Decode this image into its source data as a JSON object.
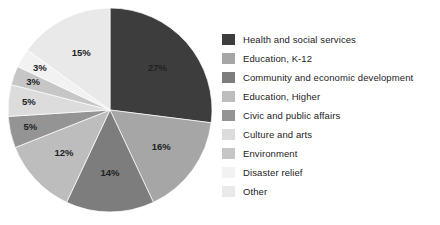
{
  "chart_data": {
    "type": "pie",
    "title": "",
    "subtitle": "",
    "xlabel": "",
    "ylabel": "",
    "legend_position": "right",
    "grid": false,
    "start_angle_deg": 0,
    "direction": "clockwise",
    "categories": [
      "Health and social services",
      "Education, K-12",
      "Community and economic development",
      "Education, Higher",
      "Civic and public affairs",
      "Culture and arts",
      "Environment",
      "Disaster relief",
      "Other"
    ],
    "values": [
      27,
      16,
      14,
      12,
      5,
      5,
      3,
      3,
      15
    ],
    "value_labels": [
      "27%",
      "16%",
      "14%",
      "12%",
      "5%",
      "5%",
      "3%",
      "3%",
      "15%"
    ],
    "colors": [
      "#3d3d3d",
      "#a6a6a6",
      "#7d7d7d",
      "#bdbdbd",
      "#949494",
      "#dcdcdc",
      "#c6c6c6",
      "#f2f2f2",
      "#e9e9e9"
    ],
    "label_text_colors": [
      "#ffffff",
      "#1a1a1a",
      "#1a1a1a",
      "#1a1a1a",
      "#1a1a1a",
      "#1a1a1a",
      "#1a1a1a",
      "#1a1a1a",
      "#1a1a1a"
    ]
  },
  "legend": {
    "items": [
      {
        "label": "Health and social services",
        "color": "#3d3d3d"
      },
      {
        "label": "Education, K-12",
        "color": "#a6a6a6"
      },
      {
        "label": "Community and economic development",
        "color": "#7d7d7d"
      },
      {
        "label": "Education, Higher",
        "color": "#bdbdbd"
      },
      {
        "label": "Civic and public affairs",
        "color": "#949494"
      },
      {
        "label": "Culture and arts",
        "color": "#dcdcdc"
      },
      {
        "label": "Environment",
        "color": "#c6c6c6"
      },
      {
        "label": "Disaster relief",
        "color": "#f2f2f2"
      },
      {
        "label": "Other",
        "color": "#e9e9e9"
      }
    ]
  }
}
